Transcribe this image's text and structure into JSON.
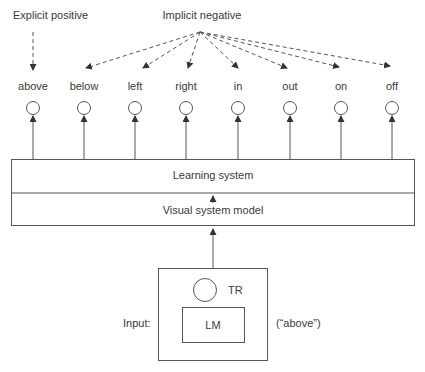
{
  "title_left": "Explicit positive",
  "title_right": "Implicit negative",
  "outputs": [
    {
      "label": "above",
      "x": 33
    },
    {
      "label": "below",
      "x": 84
    },
    {
      "label": "left",
      "x": 135
    },
    {
      "label": "right",
      "x": 186
    },
    {
      "label": "in",
      "x": 238
    },
    {
      "label": "out",
      "x": 290
    },
    {
      "label": "on",
      "x": 341
    },
    {
      "label": "off",
      "x": 392
    }
  ],
  "boxes": {
    "learning": "Learning system",
    "visual": "Visual system model"
  },
  "input": {
    "label": "Input:",
    "trajector": "TR",
    "landmark": "LM",
    "word": "(“above”)"
  },
  "colors": {
    "line": "#555555",
    "text": "#3a3a3a"
  }
}
